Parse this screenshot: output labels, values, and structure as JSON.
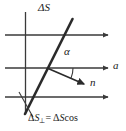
{
  "figure": {
    "kind": "physics-vector-diagram",
    "labels": {
      "delta_s": "ΔS",
      "alpha": "α",
      "axis_a": "a",
      "normal_n": "n",
      "projection": {
        "delta": "Δ",
        "s": "S",
        "perp": "⊥",
        "equals": "=",
        "delta2": "Δ",
        "s2": "S",
        "cos": "cos"
      }
    },
    "colors": {
      "stroke": "#3a3a3a",
      "thick_stroke": "#2b2b2b",
      "text": "#1a1a1a",
      "background": "#ffffff"
    },
    "geometry": {
      "vertical_line": {
        "x": 25,
        "y1": 12,
        "y2": 114
      },
      "horizontal_arrows": [
        {
          "x1": 5,
          "y": 35,
          "x2": 110
        },
        {
          "x1": 5,
          "y": 68,
          "x2": 110
        },
        {
          "x1": 5,
          "y": 97,
          "x2": 110
        }
      ],
      "delta_s_line": {
        "x1": 25,
        "y1": 113,
        "x2": 72,
        "y2": 20
      },
      "normal_vector": {
        "x1": 47,
        "y1": 68,
        "x2": 86,
        "y2": 85
      },
      "angle_arc": {
        "cx": 47,
        "cy": 68,
        "radius": 26,
        "start_deg": 0,
        "end_deg": 24
      },
      "leader_line": {
        "x1": 33,
        "y1": 116,
        "x2": 19,
        "y2": 93
      }
    }
  }
}
